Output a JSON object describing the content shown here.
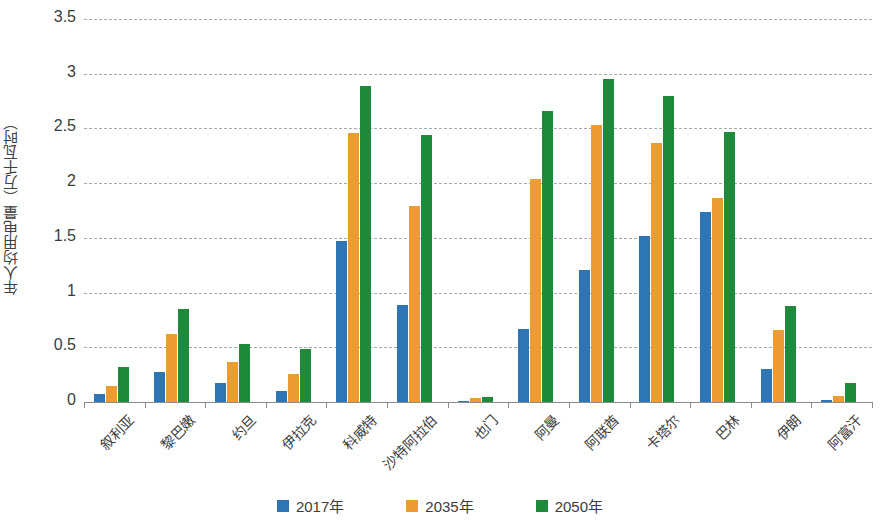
{
  "chart_data": {
    "type": "bar",
    "title": "",
    "xlabel": "",
    "ylabel": "年人均用电量（万千瓦时）",
    "ylim": [
      0,
      3.5
    ],
    "ytick_labels": [
      "0",
      "0.5",
      "1",
      "1.5",
      "2",
      "2.5",
      "3",
      "3.5"
    ],
    "ytick_values": [
      0,
      0.5,
      1,
      1.5,
      2,
      2.5,
      3,
      3.5
    ],
    "grid": true,
    "legend_position": "bottom",
    "categories": [
      "叙利亚",
      "黎巴嫩",
      "约旦",
      "伊拉克",
      "科威特",
      "沙特阿拉伯",
      "也门",
      "阿曼",
      "阿联酋",
      "卡塔尔",
      "巴林",
      "伊朗",
      "阿富汗"
    ],
    "series": [
      {
        "name": "2017年",
        "color": "#2E75B6",
        "values": [
          0.07,
          0.27,
          0.17,
          0.1,
          1.47,
          0.89,
          0.01,
          0.67,
          1.21,
          1.52,
          1.74,
          0.3,
          0.015
        ]
      },
      {
        "name": "2035年",
        "color": "#ED9B33",
        "values": [
          0.15,
          0.62,
          0.37,
          0.26,
          2.46,
          1.79,
          0.035,
          2.04,
          2.53,
          2.37,
          1.86,
          0.66,
          0.055
        ]
      },
      {
        "name": "2050年",
        "color": "#1F8A3C",
        "values": [
          0.32,
          0.85,
          0.53,
          0.48,
          2.89,
          2.44,
          0.05,
          2.66,
          2.95,
          2.8,
          2.47,
          0.88,
          0.17
        ]
      }
    ]
  }
}
